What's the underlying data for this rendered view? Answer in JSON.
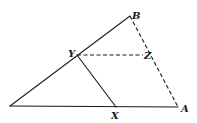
{
  "diagram": {
    "type": "geometry-triangle",
    "points": {
      "O": {
        "x": 10,
        "y": 106,
        "label": ""
      },
      "B": {
        "x": 130,
        "y": 16,
        "label": "B"
      },
      "Y": {
        "x": 77,
        "y": 55,
        "label": "Y"
      },
      "Z": {
        "x": 143,
        "y": 55,
        "label": "Z"
      },
      "X": {
        "x": 116,
        "y": 107,
        "label": "X"
      },
      "A": {
        "x": 178,
        "y": 107,
        "label": "A"
      }
    },
    "labels": {
      "B": "B",
      "Y": "Y",
      "Z": "Z",
      "X": "X",
      "A": "A"
    },
    "segments": [
      {
        "from": "O",
        "to": "B",
        "style": "solid"
      },
      {
        "from": "O",
        "to": "A",
        "style": "solid"
      },
      {
        "from": "Y",
        "to": "X",
        "style": "solid"
      },
      {
        "from": "Y",
        "to": "Z",
        "style": "dashed"
      },
      {
        "from": "B",
        "to": "A",
        "style": "dashed"
      }
    ]
  }
}
